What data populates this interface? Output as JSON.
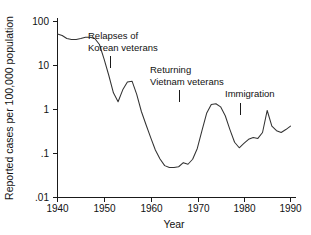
{
  "chart_data": {
    "type": "line",
    "title": "",
    "subtitle": "",
    "xlabel": "Year",
    "ylabel": "Reported cases per 100,000 population",
    "xlim": [
      1938,
      1991
    ],
    "ylim": [
      0.01,
      200
    ],
    "yscale": "log",
    "xscale": "linear",
    "grid": false,
    "legend": null,
    "xticks": [
      1940,
      1950,
      1960,
      1970,
      1980,
      1990
    ],
    "xticklabels": [
      "1940",
      "1950",
      "1960",
      "1970",
      "1980",
      "1990"
    ],
    "yticks": [
      0.01,
      0.1,
      1,
      10,
      100
    ],
    "yticklabels": [
      ".01",
      ".1",
      "1",
      "10",
      "100"
    ],
    "series": [
      {
        "name": "Reported cases per 100,000 population",
        "x": [
          1940,
          1941,
          1942,
          1943,
          1944,
          1945,
          1946,
          1947,
          1948,
          1949,
          1950,
          1951,
          1952,
          1953,
          1954,
          1955,
          1956,
          1957,
          1958,
          1959,
          1960,
          1961,
          1962,
          1963,
          1964,
          1965,
          1966,
          1967,
          1968,
          1969,
          1970,
          1971,
          1972,
          1973,
          1974,
          1975,
          1976,
          1977,
          1978,
          1979,
          1980,
          1981,
          1982,
          1983,
          1984,
          1985,
          1986,
          1987,
          1988,
          1989,
          1990
        ],
        "y": [
          52,
          48,
          41,
          39,
          39,
          41,
          44,
          44,
          41,
          30,
          14,
          6.0,
          2.4,
          1.5,
          2.8,
          4.2,
          4.4,
          2.2,
          0.9,
          0.45,
          0.23,
          0.12,
          0.075,
          0.053,
          0.048,
          0.048,
          0.05,
          0.062,
          0.057,
          0.074,
          0.13,
          0.33,
          0.82,
          1.3,
          1.35,
          1.15,
          0.72,
          0.35,
          0.18,
          0.135,
          0.17,
          0.21,
          0.23,
          0.22,
          0.3,
          0.95,
          0.42,
          0.33,
          0.3,
          0.35,
          0.42
        ],
        "color": "#333333"
      }
    ],
    "annotations": [
      {
        "id": "korean-veterans",
        "lines": [
          "Relapses of",
          "Korean veterans"
        ],
        "text_x": 88,
        "text_y": 39,
        "pointer_x": 110,
        "pointer_y_top": 56,
        "pointer_y_bottom": 68
      },
      {
        "id": "vietnam-veterans",
        "lines": [
          "Returning",
          "Vietnam veterans"
        ],
        "text_x": 150,
        "text_y": 73,
        "pointer_x": 179,
        "pointer_y_top": 90,
        "pointer_y_bottom": 102
      },
      {
        "id": "immigration",
        "lines": [
          "Immigration"
        ],
        "text_x": 225,
        "text_y": 97,
        "pointer_x": 240,
        "pointer_y_top": 103,
        "pointer_y_bottom": 115
      }
    ]
  },
  "axes": {
    "x_title": "Year",
    "y_title": "Reported cases per 100,000 population"
  }
}
